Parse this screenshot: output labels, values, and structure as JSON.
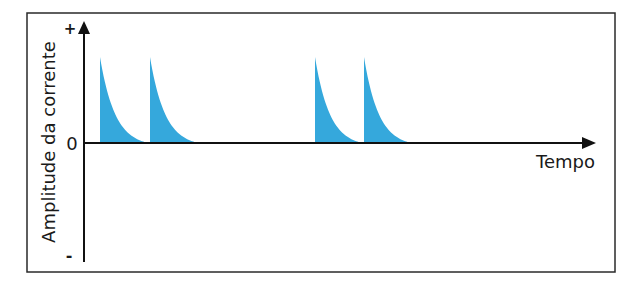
{
  "chart_data": {
    "type": "area",
    "title": "",
    "xlabel": "Tempo",
    "ylabel": "Amplitude da corrente",
    "y_ticks": {
      "plus": "+",
      "zero": "0",
      "minus": "-"
    },
    "pulses": [
      {
        "start": 100,
        "end": 148,
        "peak": 1.0
      },
      {
        "start": 150,
        "end": 198,
        "peak": 1.0
      },
      {
        "start": 315,
        "end": 362,
        "peak": 1.0
      },
      {
        "start": 364,
        "end": 411,
        "peak": 1.0
      }
    ],
    "fill_color": "#35A8DC",
    "ylim": [
      -1.4,
      1.0
    ],
    "grid": false,
    "legend": null
  },
  "labels": {
    "plus": "+",
    "zero": "0",
    "minus": "-",
    "xlabel": "Tempo",
    "ylabel": "Amplitude da corrente"
  }
}
